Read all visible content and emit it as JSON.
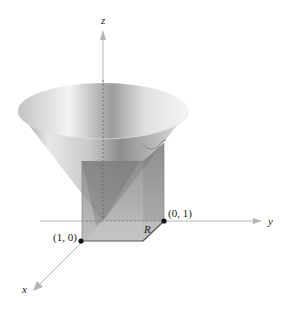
{
  "figure": {
    "axes": {
      "x_label": "x",
      "y_label": "y",
      "z_label": "z"
    },
    "points": [
      {
        "label": "(1, 0)",
        "name": "point-1-0"
      },
      {
        "label": "(0, 1)",
        "name": "point-0-1"
      }
    ],
    "region_label": "R",
    "colors": {
      "axis": "#b5b5b5",
      "cone_light": "#f2f2f2",
      "cone_dark": "#8a8a8a",
      "box_fill": "#9a9a9a",
      "box_edge": "#555555",
      "point": "#111111"
    }
  }
}
